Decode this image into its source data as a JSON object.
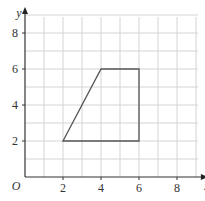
{
  "chart_data": {
    "type": "line",
    "title": "",
    "xlabel": "x",
    "ylabel": "y",
    "origin_label": "O",
    "xlim": [
      0,
      9
    ],
    "ylim": [
      0,
      9
    ],
    "grid": true,
    "grid_step": 1,
    "x_ticks": [
      2,
      4,
      6,
      8
    ],
    "y_ticks": [
      2,
      4,
      6,
      8
    ],
    "series": [
      {
        "name": "trapezium",
        "closed": true,
        "points": [
          [
            2,
            2
          ],
          [
            4,
            6
          ],
          [
            6,
            6
          ],
          [
            6,
            2
          ]
        ],
        "color": "#555555"
      }
    ]
  }
}
